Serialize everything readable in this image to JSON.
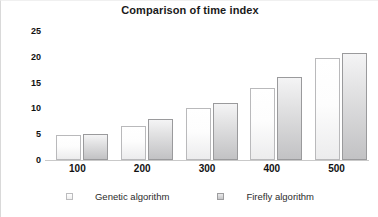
{
  "chart_data": {
    "type": "bar",
    "title": "Comparison of time index",
    "xlabel": "",
    "ylabel": "",
    "categories": [
      "100",
      "200",
      "300",
      "400",
      "500"
    ],
    "series": [
      {
        "name": "Genetic algorithm",
        "values": [
          4.8,
          6.5,
          10.0,
          14.0,
          19.8
        ],
        "color": "#fdfdfd"
      },
      {
        "name": "Firefly algorithm",
        "values": [
          5.0,
          8.0,
          11.0,
          16.0,
          20.8
        ],
        "color": "#c6c6c8"
      }
    ],
    "yticks": [
      0,
      5,
      10,
      15,
      20,
      25
    ],
    "ylim": [
      0,
      25
    ],
    "grid": false,
    "legend_position": "bottom"
  }
}
